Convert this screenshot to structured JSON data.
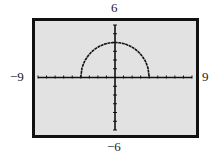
{
  "chart_data": {
    "type": "line",
    "title": "",
    "xlabel": "",
    "ylabel": "",
    "xlim": [
      -9,
      9
    ],
    "ylim": [
      -6,
      6
    ],
    "window_labels": {
      "top": "6",
      "bottom": "-6",
      "left": "-9",
      "right": "9"
    },
    "xscale": 1,
    "yscale": 1,
    "series": [
      {
        "name": "upper semicircle y = sqrt(16 - x^2)",
        "center": [
          0,
          4
        ],
        "radius": 4,
        "x_range": [
          -4,
          4
        ],
        "y_max": 4
      }
    ],
    "grid": false,
    "background": "#e2e2e2",
    "frame_color": "#111111"
  },
  "labels": {
    "top": "6",
    "bottom": "−6",
    "left": "−9",
    "right": "9"
  }
}
